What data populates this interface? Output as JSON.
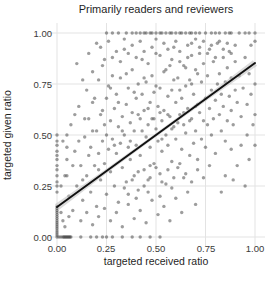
{
  "chart_data": {
    "type": "scatter",
    "title": "Primarily readers and reviewers",
    "xlabel": "targeted received ratio",
    "ylabel": "targeted given ratio",
    "xlim": [
      -0.05,
      1.05
    ],
    "ylim": [
      -0.05,
      1.05
    ],
    "grid": true,
    "grid_color": "#e3e3e3",
    "legend": "none",
    "x_ticks": [
      "0.00",
      "0.25",
      "0.50",
      "0.75",
      "1.00"
    ],
    "y_ticks": [
      "0.00",
      "0.25",
      "0.50",
      "0.75",
      "1.00"
    ],
    "x_tick_values": [
      0,
      0.25,
      0.5,
      0.75,
      1
    ],
    "y_tick_values": [
      0,
      0.25,
      0.5,
      0.75,
      1
    ],
    "point_color": "#3c3c3c",
    "point_opacity": 0.5,
    "point_radius": 1.7,
    "trend_line": {
      "x1": 0,
      "y1": 0.147,
      "x2": 1,
      "y2": 0.853,
      "color": "#111111",
      "width": 2,
      "band_color": "#bdbdbd",
      "band_opacity": 0.55,
      "band_halfwidth_mid": 1.5,
      "band_halfwidth_end": 3.5
    },
    "points": [
      [
        0,
        0
      ],
      [
        0,
        0.01
      ],
      [
        0,
        0.02
      ],
      [
        0,
        0.03
      ],
      [
        0,
        0.04
      ],
      [
        0,
        0.05
      ],
      [
        0,
        0.06
      ],
      [
        0,
        0.07
      ],
      [
        0,
        0.08
      ],
      [
        0,
        0.09
      ],
      [
        0,
        0.1
      ],
      [
        0,
        0.11
      ],
      [
        0,
        0.12
      ],
      [
        0,
        0.13
      ],
      [
        0,
        0.14
      ],
      [
        0,
        0.15
      ],
      [
        0,
        0.22
      ],
      [
        0,
        0.25
      ],
      [
        0,
        0.27
      ],
      [
        0,
        0.3
      ],
      [
        0,
        0.33
      ],
      [
        0,
        0.35
      ],
      [
        0,
        0.38
      ],
      [
        0,
        0.4
      ],
      [
        0,
        0.42
      ],
      [
        0,
        0.45
      ],
      [
        0,
        0.47
      ],
      [
        0,
        0.5
      ],
      [
        0.01,
        0
      ],
      [
        0.02,
        0
      ],
      [
        0.03,
        0
      ],
      [
        0.035,
        0
      ],
      [
        0.04,
        0
      ],
      [
        0.045,
        0
      ],
      [
        0.05,
        0
      ],
      [
        0.055,
        0
      ],
      [
        0.06,
        0
      ],
      [
        0.065,
        0
      ],
      [
        0.07,
        0
      ],
      [
        0.12,
        0
      ],
      [
        0.17,
        0
      ],
      [
        0.2,
        0
      ],
      [
        0.23,
        0
      ],
      [
        0.25,
        0
      ],
      [
        0.28,
        0
      ],
      [
        0.33,
        0
      ],
      [
        0.38,
        0
      ],
      [
        0.42,
        0
      ],
      [
        0.47,
        0
      ],
      [
        0.52,
        0
      ],
      [
        0.25,
        1
      ],
      [
        0.28,
        1
      ],
      [
        0.31,
        1
      ],
      [
        0.35,
        1
      ],
      [
        0.38,
        1
      ],
      [
        0.4,
        1
      ],
      [
        0.42,
        1
      ],
      [
        0.44,
        1
      ],
      [
        0.45,
        1
      ],
      [
        0.47,
        1
      ],
      [
        0.48,
        1
      ],
      [
        0.5,
        1
      ],
      [
        0.52,
        1
      ],
      [
        0.53,
        1
      ],
      [
        0.55,
        1
      ],
      [
        0.57,
        1
      ],
      [
        0.58,
        1
      ],
      [
        0.6,
        1
      ],
      [
        0.62,
        1
      ],
      [
        0.63,
        1
      ],
      [
        0.65,
        1
      ],
      [
        0.67,
        1
      ],
      [
        0.68,
        1
      ],
      [
        0.7,
        1
      ],
      [
        0.72,
        1
      ],
      [
        0.75,
        1
      ],
      [
        0.78,
        1
      ],
      [
        0.8,
        1
      ],
      [
        0.82,
        1
      ],
      [
        0.85,
        1
      ],
      [
        0.87,
        1
      ],
      [
        0.88,
        1
      ],
      [
        0.92,
        1
      ],
      [
        0.95,
        1
      ],
      [
        0.97,
        1
      ],
      [
        1,
        1
      ],
      [
        0.05,
        0.3
      ],
      [
        0.07,
        0.55
      ],
      [
        0.08,
        0.13
      ],
      [
        0.09,
        0.42
      ],
      [
        0.1,
        0.25
      ],
      [
        0.11,
        0.64
      ],
      [
        0.12,
        0.35
      ],
      [
        0.13,
        0.18
      ],
      [
        0.14,
        0.49
      ],
      [
        0.15,
        0.72
      ],
      [
        0.15,
        0.3
      ],
      [
        0.16,
        0.58
      ],
      [
        0.17,
        0.22
      ],
      [
        0.17,
        0.44
      ],
      [
        0.18,
        0.66
      ],
      [
        0.19,
        0.35
      ],
      [
        0.2,
        0.52
      ],
      [
        0.2,
        0.15
      ],
      [
        0.21,
        0.77
      ],
      [
        0.21,
        0.41
      ],
      [
        0.22,
        0.28
      ],
      [
        0.22,
        0.6
      ],
      [
        0.23,
        0.47
      ],
      [
        0.23,
        0.84
      ],
      [
        0.24,
        0.36
      ],
      [
        0.24,
        0.55
      ],
      [
        0.25,
        0.68
      ],
      [
        0.25,
        0.21
      ],
      [
        0.26,
        0.43
      ],
      [
        0.26,
        0.74
      ],
      [
        0.27,
        0.32
      ],
      [
        0.27,
        0.57
      ],
      [
        0.28,
        0.48
      ],
      [
        0.28,
        0.88
      ],
      [
        0.29,
        0.25
      ],
      [
        0.29,
        0.63
      ],
      [
        0.3,
        0.41
      ],
      [
        0.3,
        0.7
      ],
      [
        0.31,
        0.54
      ],
      [
        0.31,
        0.17
      ],
      [
        0.32,
        0.46
      ],
      [
        0.32,
        0.78
      ],
      [
        0.33,
        0.34
      ],
      [
        0.33,
        0.59
      ],
      [
        0.34,
        0.5
      ],
      [
        0.34,
        0.92
      ],
      [
        0.35,
        0.27
      ],
      [
        0.35,
        0.65
      ],
      [
        0.36,
        0.44
      ],
      [
        0.36,
        0.73
      ],
      [
        0.37,
        0.56
      ],
      [
        0.37,
        0.38
      ],
      [
        0.38,
        0.61
      ],
      [
        0.38,
        0.82
      ],
      [
        0.39,
        0.3
      ],
      [
        0.39,
        0.52
      ],
      [
        0.4,
        0.68
      ],
      [
        0.4,
        0.45
      ],
      [
        0.41,
        0.75
      ],
      [
        0.41,
        0.23
      ],
      [
        0.42,
        0.58
      ],
      [
        0.42,
        0.4
      ],
      [
        0.43,
        0.7
      ],
      [
        0.43,
        0.87
      ],
      [
        0.44,
        0.33
      ],
      [
        0.44,
        0.62
      ],
      [
        0.45,
        0.49
      ],
      [
        0.45,
        0.76
      ],
      [
        0.46,
        0.55
      ],
      [
        0.46,
        0.28
      ],
      [
        0.47,
        0.66
      ],
      [
        0.47,
        0.44
      ],
      [
        0.48,
        0.79
      ],
      [
        0.48,
        0.58
      ],
      [
        0.49,
        0.36
      ],
      [
        0.49,
        0.71
      ],
      [
        0.5,
        0.53
      ],
      [
        0.5,
        0.9
      ],
      [
        0.51,
        0.47
      ],
      [
        0.51,
        0.64
      ],
      [
        0.52,
        0.31
      ],
      [
        0.52,
        0.73
      ],
      [
        0.53,
        0.57
      ],
      [
        0.53,
        0.42
      ],
      [
        0.54,
        0.81
      ],
      [
        0.54,
        0.62
      ],
      [
        0.55,
        0.5
      ],
      [
        0.55,
        0.26
      ],
      [
        0.56,
        0.69
      ],
      [
        0.56,
        0.45
      ],
      [
        0.57,
        0.84
      ],
      [
        0.57,
        0.59
      ],
      [
        0.58,
        0.37
      ],
      [
        0.58,
        0.72
      ],
      [
        0.59,
        0.54
      ],
      [
        0.59,
        0.93
      ],
      [
        0.6,
        0.48
      ],
      [
        0.6,
        0.66
      ],
      [
        0.61,
        0.78
      ],
      [
        0.61,
        0.34
      ],
      [
        0.62,
        0.6
      ],
      [
        0.62,
        0.86
      ],
      [
        0.63,
        0.43
      ],
      [
        0.63,
        0.68
      ],
      [
        0.64,
        0.55
      ],
      [
        0.64,
        0.29
      ],
      [
        0.65,
        0.74
      ],
      [
        0.65,
        0.51
      ],
      [
        0.66,
        0.88
      ],
      [
        0.66,
        0.63
      ],
      [
        0.67,
        0.4
      ],
      [
        0.67,
        0.77
      ],
      [
        0.68,
        0.58
      ],
      [
        0.68,
        0.95
      ],
      [
        0.69,
        0.46
      ],
      [
        0.69,
        0.7
      ],
      [
        0.7,
        0.82
      ],
      [
        0.7,
        0.52
      ],
      [
        0.71,
        0.65
      ],
      [
        0.71,
        0.38
      ],
      [
        0.72,
        0.9
      ],
      [
        0.72,
        0.61
      ],
      [
        0.73,
        0.48
      ],
      [
        0.73,
        0.76
      ],
      [
        0.74,
        0.57
      ],
      [
        0.74,
        0.85
      ],
      [
        0.75,
        0.68
      ],
      [
        0.75,
        0.44
      ],
      [
        0.76,
        0.79
      ],
      [
        0.76,
        0.55
      ],
      [
        0.77,
        0.92
      ],
      [
        0.77,
        0.63
      ],
      [
        0.78,
        0.5
      ],
      [
        0.78,
        0.72
      ],
      [
        0.79,
        0.86
      ],
      [
        0.79,
        0.58
      ],
      [
        0.8,
        0.67
      ],
      [
        0.8,
        0.41
      ],
      [
        0.81,
        0.75
      ],
      [
        0.81,
        0.95
      ],
      [
        0.82,
        0.6
      ],
      [
        0.82,
        0.8
      ],
      [
        0.83,
        0.52
      ],
      [
        0.83,
        0.7
      ],
      [
        0.84,
        0.88
      ],
      [
        0.84,
        0.64
      ],
      [
        0.85,
        0.47
      ],
      [
        0.85,
        0.76
      ],
      [
        0.86,
        0.83
      ],
      [
        0.86,
        0.57
      ],
      [
        0.87,
        0.69
      ],
      [
        0.87,
        0.91
      ],
      [
        0.88,
        0.62
      ],
      [
        0.88,
        0.78
      ],
      [
        0.89,
        0.55
      ],
      [
        0.9,
        0.72
      ],
      [
        0.9,
        0.86
      ],
      [
        0.91,
        0.66
      ],
      [
        0.92,
        0.79
      ],
      [
        0.93,
        0.59
      ],
      [
        0.94,
        0.73
      ],
      [
        0.95,
        0.88
      ],
      [
        0.96,
        0.65
      ],
      [
        0.97,
        0.8
      ],
      [
        0.98,
        0.94
      ],
      [
        0.98,
        0.7
      ],
      [
        1,
        0.96
      ],
      [
        1,
        0.75
      ],
      [
        1,
        0.6
      ],
      [
        1,
        0.45
      ],
      [
        0.99,
        0.55
      ],
      [
        0.96,
        0.5
      ],
      [
        0.93,
        0.45
      ],
      [
        0.91,
        0.35
      ],
      [
        0.89,
        0.28
      ],
      [
        0.95,
        0.25
      ],
      [
        0.88,
        0.43
      ],
      [
        0.85,
        0.3
      ],
      [
        0.83,
        0.22
      ],
      [
        0.97,
        0.38
      ],
      [
        0.1,
        0.85
      ],
      [
        0.13,
        0.77
      ],
      [
        0.16,
        0.9
      ],
      [
        0.18,
        0.81
      ],
      [
        0.2,
        0.95
      ],
      [
        0.22,
        0.93
      ],
      [
        0.24,
        0.87
      ],
      [
        0.26,
        0.96
      ],
      [
        0.28,
        0.79
      ],
      [
        0.3,
        0.91
      ],
      [
        0.32,
        0.86
      ],
      [
        0.34,
        0.97
      ],
      [
        0.36,
        0.9
      ],
      [
        0.38,
        0.94
      ],
      [
        0.4,
        0.88
      ],
      [
        0.42,
        0.96
      ],
      [
        0.44,
        0.91
      ],
      [
        0.46,
        0.85
      ],
      [
        0.48,
        0.93
      ],
      [
        0.5,
        0.97
      ],
      [
        0.52,
        0.89
      ],
      [
        0.54,
        0.95
      ],
      [
        0.56,
        0.92
      ],
      [
        0.58,
        0.87
      ],
      [
        0.6,
        0.96
      ],
      [
        0.62,
        0.91
      ],
      [
        0.64,
        0.84
      ],
      [
        0.66,
        0.94
      ],
      [
        0.68,
        0.89
      ],
      [
        0.7,
        0.97
      ],
      [
        0.72,
        0.93
      ],
      [
        0.74,
        0.96
      ],
      [
        0.76,
        0.9
      ],
      [
        0.78,
        0.94
      ],
      [
        0.8,
        0.88
      ],
      [
        0.82,
        0.96
      ],
      [
        0.84,
        0.92
      ],
      [
        0.86,
        0.95
      ],
      [
        0.88,
        0.9
      ],
      [
        0.9,
        0.94
      ],
      [
        0.12,
        0.08
      ],
      [
        0.15,
        0.12
      ],
      [
        0.18,
        0.06
      ],
      [
        0.21,
        0.1
      ],
      [
        0.24,
        0.14
      ],
      [
        0.27,
        0.08
      ],
      [
        0.3,
        0.12
      ],
      [
        0.33,
        0.05
      ],
      [
        0.36,
        0.16
      ],
      [
        0.39,
        0.09
      ],
      [
        0.42,
        0.13
      ],
      [
        0.45,
        0.07
      ],
      [
        0.48,
        0.18
      ],
      [
        0.51,
        0.11
      ],
      [
        0.54,
        0.15
      ],
      [
        0.57,
        0.08
      ],
      [
        0.6,
        0.19
      ],
      [
        0.63,
        0.12
      ],
      [
        0.66,
        0.22
      ],
      [
        0.7,
        0.16
      ],
      [
        0.06,
        0.2
      ],
      [
        0.08,
        0.35
      ],
      [
        0.09,
        0.6
      ],
      [
        0.11,
        0.47
      ],
      [
        0.13,
        0.28
      ],
      [
        0.14,
        0.58
      ],
      [
        0.16,
        0.4
      ],
      [
        0.18,
        0.52
      ],
      [
        0.19,
        0.68
      ],
      [
        0.21,
        0.33
      ],
      [
        0.23,
        0.62
      ],
      [
        0.25,
        0.5
      ],
      [
        0.27,
        0.73
      ],
      [
        0.29,
        0.45
      ],
      [
        0.31,
        0.66
      ],
      [
        0.33,
        0.52
      ],
      [
        0.35,
        0.8
      ],
      [
        0.37,
        0.47
      ],
      [
        0.39,
        0.71
      ],
      [
        0.41,
        0.6
      ],
      [
        0.43,
        0.52
      ],
      [
        0.44,
        0.78
      ],
      [
        0.46,
        0.63
      ],
      [
        0.47,
        0.35
      ],
      [
        0.49,
        0.58
      ],
      [
        0.5,
        0.74
      ],
      [
        0.52,
        0.61
      ],
      [
        0.53,
        0.48
      ],
      [
        0.55,
        0.82
      ],
      [
        0.56,
        0.6
      ],
      [
        0.58,
        0.53
      ],
      [
        0.59,
        0.77
      ],
      [
        0.61,
        0.56
      ],
      [
        0.62,
        0.72
      ],
      [
        0.64,
        0.61
      ],
      [
        0.65,
        0.83
      ],
      [
        0.67,
        0.57
      ],
      [
        0.68,
        0.75
      ],
      [
        0.7,
        0.64
      ],
      [
        0.71,
        0.8
      ],
      [
        0.34,
        0.24
      ],
      [
        0.38,
        0.28
      ],
      [
        0.41,
        0.32
      ],
      [
        0.44,
        0.25
      ],
      [
        0.47,
        0.29
      ],
      [
        0.5,
        0.34
      ],
      [
        0.53,
        0.27
      ],
      [
        0.56,
        0.33
      ],
      [
        0.59,
        0.29
      ],
      [
        0.62,
        0.36
      ],
      [
        0.65,
        0.31
      ],
      [
        0.68,
        0.27
      ],
      [
        0.71,
        0.33
      ],
      [
        0.74,
        0.29
      ],
      [
        0.77,
        0.35
      ],
      [
        0.36,
        0.21
      ],
      [
        0.4,
        0.19
      ],
      [
        0.46,
        0.22
      ],
      [
        0.52,
        0.2
      ],
      [
        0.58,
        0.24
      ],
      [
        0.05,
        0.38
      ],
      [
        0.05,
        0.44
      ],
      [
        0.05,
        0.5
      ],
      [
        0.04,
        0.3
      ],
      [
        0.03,
        0.47
      ],
      [
        0.02,
        0.12
      ],
      [
        0.03,
        0.08
      ],
      [
        0.04,
        0.05
      ],
      [
        0.02,
        0.25
      ],
      [
        0.06,
        0.1
      ]
    ]
  }
}
